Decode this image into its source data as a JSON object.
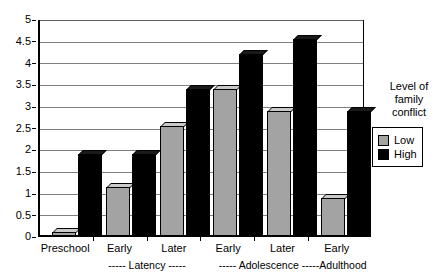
{
  "chart_data": {
    "type": "bar",
    "title": "",
    "xlabel": "",
    "ylabel": "",
    "ylim": [
      0,
      5
    ],
    "ytick_labels": [
      "5",
      "4.5",
      "4",
      "3.5",
      "3",
      "2.5",
      "2",
      "1.5",
      "1",
      "0.5",
      "0"
    ],
    "ytick_values": [
      5,
      4.5,
      4,
      3.5,
      3,
      2.5,
      2,
      1.5,
      1,
      0.5,
      0
    ],
    "grid": true,
    "categories": [
      "Preschool",
      "Early",
      "Later",
      "Early",
      "Later",
      "Early"
    ],
    "group_spans": [
      "",
      "----- Latency -----",
      "----- Adolescence -----",
      "Adulthood"
    ],
    "series": [
      {
        "name": "Low",
        "color": "#a3a3a3",
        "values": [
          0.2,
          1.25,
          2.65,
          3.5,
          3.0,
          1.0
        ]
      },
      {
        "name": "High",
        "color": "#000000",
        "values": [
          2.0,
          2.0,
          3.5,
          4.3,
          4.65,
          3.0
        ]
      }
    ],
    "legend": {
      "position": "right",
      "title_lines": [
        "Level of",
        "family",
        "conflict"
      ],
      "entries": [
        {
          "label": "Low",
          "color": "#a3a3a3"
        },
        {
          "label": "High",
          "color": "#000000"
        }
      ]
    }
  },
  "axis": {
    "y_labels": [
      "5",
      "4.5",
      "4",
      "3.5",
      "3",
      "2.5",
      "2",
      "1.5",
      "1",
      "0.5",
      "0"
    ],
    "x_labels": [
      "Preschool",
      "Early",
      "Later",
      "Early",
      "Later",
      "Early"
    ],
    "span_latency": "----- Latency -----",
    "span_adolescence": "----- Adolescence -----",
    "span_adulthood": "Adulthood"
  },
  "legend": {
    "title_line_1": "Level of",
    "title_line_2": "family",
    "title_line_3": "conflict",
    "low_label": "Low",
    "high_label": "High"
  }
}
